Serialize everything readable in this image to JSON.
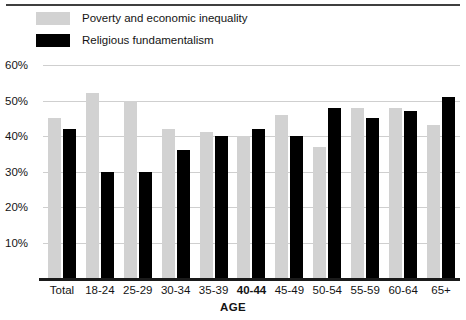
{
  "chart_data": {
    "type": "bar",
    "title": "",
    "xlabel": "AGE",
    "ylabel": "",
    "ylim": [
      0,
      60
    ],
    "ytick_values": [
      60,
      50,
      40,
      30,
      20,
      10
    ],
    "ytick_labels": [
      "60%",
      "50%",
      "40%",
      "30%",
      "20%",
      "10%"
    ],
    "grid": true,
    "legend_position": "top-left",
    "categories": [
      "Total",
      "18-24",
      "25-29",
      "30-34",
      "35-39",
      "40-44",
      "45-49",
      "50-54",
      "55-59",
      "60-64",
      "65+"
    ],
    "highlighted_category": "40-44",
    "series": [
      {
        "name": "Poverty and economic inequality",
        "color": "#d2d2d2",
        "values": [
          45,
          52,
          50,
          42,
          41,
          40,
          46,
          37,
          48,
          48,
          43
        ]
      },
      {
        "name": "Religious fundamentalism",
        "color": "#000000",
        "values": [
          42,
          30,
          30,
          36,
          40,
          42,
          40,
          48,
          45,
          47,
          51
        ]
      }
    ]
  },
  "legend": {
    "items": [
      {
        "label": "Poverty and economic inequality",
        "swatch": "gray-swatch-icon"
      },
      {
        "label": "Religious fundamentalism",
        "swatch": "black-swatch-icon"
      }
    ]
  }
}
